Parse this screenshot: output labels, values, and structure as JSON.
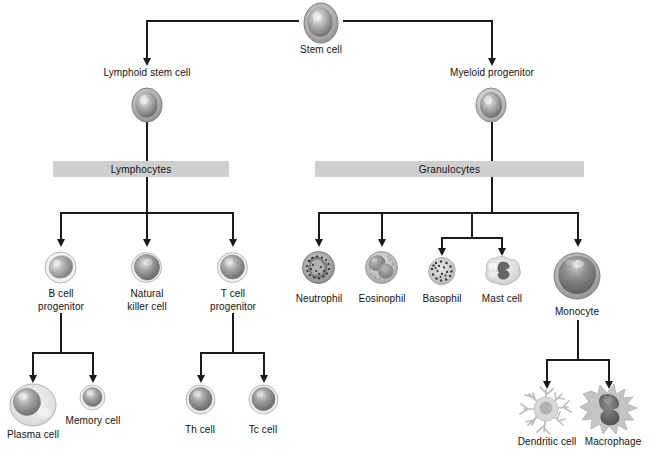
{
  "diagram": {
    "palette": {
      "line": "#1b1b1b",
      "bar_fill": "#cfcfcf",
      "cytoplasm_light": "#e3e3e3",
      "cytoplasm_mid": "#b9b9b9",
      "nucleus_dark": "#6e6e6e",
      "nucleus_darker": "#565656",
      "background": "#ffffff"
    },
    "section_bars": [
      {
        "id": "lymphocytes",
        "label": "Lymphocytes"
      },
      {
        "id": "granulocytes",
        "label": "Granulocytes"
      }
    ],
    "nodes": [
      {
        "id": "stem-cell",
        "label": "Stem cell"
      },
      {
        "id": "lymphoid-stem-cell",
        "label": "Lymphoid stem cell"
      },
      {
        "id": "myeloid-progenitor",
        "label": "Myeloid progenitor"
      },
      {
        "id": "b-cell-progenitor",
        "label": "B cell progenitor",
        "line1": "B cell",
        "line2": "progenitor"
      },
      {
        "id": "natural-killer-cell",
        "label": "Natural killer cell",
        "line1": "Natural",
        "line2": "killer cell"
      },
      {
        "id": "t-cell-progenitor",
        "label": "T cell progenitor",
        "line1": "T cell",
        "line2": "progenitor"
      },
      {
        "id": "neutrophil",
        "label": "Neutrophil"
      },
      {
        "id": "eosinophil",
        "label": "Eosinophil"
      },
      {
        "id": "basophil",
        "label": "Basophil"
      },
      {
        "id": "mast-cell",
        "label": "Mast cell"
      },
      {
        "id": "monocyte",
        "label": "Monocyte"
      },
      {
        "id": "plasma-cell",
        "label": "Plasma cell"
      },
      {
        "id": "memory-cell",
        "label": "Memory cell"
      },
      {
        "id": "th-cell",
        "label": "Th cell"
      },
      {
        "id": "tc-cell",
        "label": "Tc cell"
      },
      {
        "id": "dendritic-cell",
        "label": "Dendritic cell"
      },
      {
        "id": "macrophage",
        "label": "Macrophage"
      }
    ]
  }
}
